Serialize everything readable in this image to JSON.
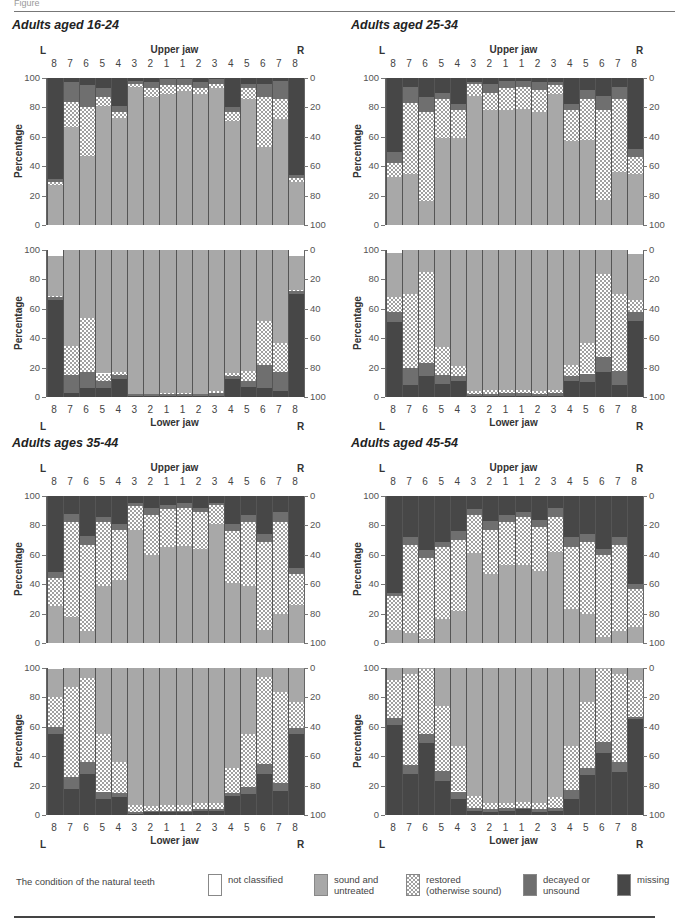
{
  "figure": {
    "label": "Figure"
  },
  "labels": {
    "upper_jaw": "Upper jaw",
    "lower_jaw": "Lower jaw",
    "left": "L",
    "right": "R",
    "ylabel": "Percentage",
    "left_ticks": [
      "100",
      "80",
      "60",
      "40",
      "20",
      "0"
    ],
    "right_ticks": [
      "0",
      "20",
      "40",
      "60",
      "80",
      "100"
    ],
    "teeth": [
      "8",
      "7",
      "6",
      "5",
      "4",
      "3",
      "2",
      "1",
      "1",
      "2",
      "3",
      "4",
      "5",
      "6",
      "7",
      "8"
    ]
  },
  "legend": {
    "caption": "The condition of the natural teeth",
    "items": [
      {
        "key": "notcl",
        "label1": "not classified",
        "label2": ""
      },
      {
        "key": "sound",
        "label1": "sound and",
        "label2": "untreated"
      },
      {
        "key": "restored",
        "label1": "restored",
        "label2": "(otherwise sound)"
      },
      {
        "key": "decayed",
        "label1": "decayed or",
        "label2": "unsound"
      },
      {
        "key": "missing",
        "label1": "missing",
        "label2": ""
      }
    ],
    "colors": {
      "sound": "#a8a8a8",
      "restored": "hatched",
      "decayed": "#6f6f6f",
      "missing": "#474747",
      "notcl": "#ffffff"
    }
  },
  "chart_data": [
    {
      "type": "bar",
      "title": "Adults aged 16-24",
      "stacked": true,
      "categories": [
        "L8",
        "L7",
        "L6",
        "L5",
        "L4",
        "L3",
        "L2",
        "L1",
        "R1",
        "R2",
        "R3",
        "R4",
        "R5",
        "R6",
        "R7",
        "R8"
      ],
      "ylim": [
        0,
        100
      ],
      "ylabel": "Percentage",
      "upper_jaw": {
        "series": [
          {
            "name": "sound and untreated",
            "values": [
              27,
              67,
              47,
              81,
              73,
              94,
              87,
              89,
              91,
              89,
              93,
              71,
              86,
              53,
              72,
              29
            ]
          },
          {
            "name": "restored (otherwise sound)",
            "values": [
              2,
              17,
              33,
              6,
              4,
              2,
              6,
              6,
              4,
              4,
              3,
              6,
              7,
              34,
              14,
              3
            ]
          },
          {
            "name": "decayed or unsound",
            "values": [
              2,
              13,
              15,
              6,
              4,
              2,
              4,
              4,
              4,
              4,
              3,
              3,
              3,
              9,
              12,
              2
            ]
          },
          {
            "name": "missing",
            "values": [
              69,
              3,
              5,
              7,
              19,
              2,
              3,
              1,
              1,
              3,
              1,
              20,
              4,
              4,
              2,
              66
            ]
          }
        ]
      },
      "lower_jaw": {
        "series": [
          {
            "name": "missing",
            "values": [
              66,
              3,
              6,
              6,
              12,
              1,
              1,
              1,
              1,
              1,
              1,
              12,
              7,
              6,
              4,
              70
            ]
          },
          {
            "name": "decayed or unsound",
            "values": [
              2,
              12,
              11,
              5,
              3,
              1,
              1,
              1,
              1,
              1,
              2,
              2,
              4,
              16,
              13,
              2
            ]
          },
          {
            "name": "restored (otherwise sound)",
            "values": [
              1,
              20,
              37,
              5,
              2,
              0,
              0,
              1,
              1,
              0,
              1,
              2,
              7,
              30,
              20,
              1
            ]
          },
          {
            "name": "sound and untreated",
            "values": [
              27,
              65,
              46,
              84,
              83,
              98,
              98,
              97,
              97,
              98,
              96,
              84,
              82,
              48,
              63,
              23
            ]
          },
          {
            "name": "not classified",
            "values": [
              4,
              0,
              0,
              0,
              0,
              0,
              0,
              0,
              0,
              0,
              0,
              0,
              0,
              0,
              0,
              4
            ]
          }
        ]
      }
    },
    {
      "type": "bar",
      "title": "Adults aged 25-34",
      "stacked": true,
      "categories": [
        "L8",
        "L7",
        "L6",
        "L5",
        "L4",
        "L3",
        "L2",
        "L1",
        "R1",
        "R2",
        "R3",
        "R4",
        "R5",
        "R6",
        "R7",
        "R8"
      ],
      "ylim": [
        0,
        100
      ],
      "ylabel": "Percentage",
      "upper_jaw": {
        "series": [
          {
            "name": "sound and untreated",
            "values": [
              33,
              35,
              16,
              59,
              59,
              88,
              78,
              78,
              79,
              77,
              89,
              57,
              58,
              17,
              36,
              35
            ]
          },
          {
            "name": "restored (otherwise sound)",
            "values": [
              9,
              48,
              61,
              27,
              19,
              8,
              12,
              15,
              15,
              15,
              6,
              21,
              28,
              61,
              50,
              11
            ]
          },
          {
            "name": "decayed or unsound",
            "values": [
              8,
              11,
              10,
              4,
              4,
              1,
              6,
              5,
              4,
              5,
              2,
              4,
              6,
              10,
              8,
              6
            ]
          },
          {
            "name": "missing",
            "values": [
              50,
              6,
              13,
              10,
              18,
              3,
              4,
              2,
              2,
              3,
              3,
              18,
              8,
              12,
              6,
              48
            ]
          }
        ]
      },
      "lower_jaw": {
        "series": [
          {
            "name": "missing",
            "values": [
              51,
              8,
              14,
              9,
              11,
              1,
              1,
              1,
              1,
              1,
              1,
              11,
              10,
              17,
              8,
              52
            ]
          },
          {
            "name": "decayed or unsound",
            "values": [
              7,
              12,
              9,
              6,
              3,
              1,
              1,
              2,
              2,
              1,
              2,
              3,
              6,
              10,
              10,
              6
            ]
          },
          {
            "name": "restored (otherwise sound)",
            "values": [
              10,
              50,
              62,
              19,
              7,
              2,
              3,
              2,
              2,
              2,
              2,
              8,
              21,
              57,
              52,
              8
            ]
          },
          {
            "name": "sound and untreated",
            "values": [
              30,
              30,
              15,
              66,
              79,
              96,
              95,
              95,
              95,
              96,
              95,
              78,
              63,
              16,
              30,
              31
            ]
          },
          {
            "name": "not classified",
            "values": [
              2,
              0,
              0,
              0,
              0,
              0,
              0,
              0,
              0,
              0,
              0,
              0,
              0,
              0,
              0,
              3
            ]
          }
        ]
      }
    },
    {
      "type": "bar",
      "title": "Adults ages 35-44",
      "stacked": true,
      "categories": [
        "L8",
        "L7",
        "L6",
        "L5",
        "L4",
        "L3",
        "L2",
        "L1",
        "R1",
        "R2",
        "R3",
        "R4",
        "R5",
        "R6",
        "R7",
        "R8"
      ],
      "ylim": [
        0,
        100
      ],
      "ylabel": "Percentage",
      "upper_jaw": {
        "series": [
          {
            "name": "sound and untreated",
            "values": [
              25,
              18,
              8,
              39,
              43,
              77,
              60,
              65,
              66,
              64,
              81,
              41,
              39,
              9,
              20,
              26
            ]
          },
          {
            "name": "restored (otherwise sound)",
            "values": [
              19,
              64,
              59,
              43,
              34,
              16,
              27,
              26,
              26,
              25,
              13,
              35,
              43,
              60,
              62,
              21
            ]
          },
          {
            "name": "decayed or unsound",
            "values": [
              4,
              6,
              6,
              4,
              4,
              2,
              5,
              3,
              3,
              3,
              1,
              5,
              5,
              5,
              7,
              4
            ]
          },
          {
            "name": "missing",
            "values": [
              52,
              12,
              27,
              14,
              19,
              5,
              8,
              6,
              5,
              8,
              5,
              19,
              13,
              26,
              11,
              49
            ]
          }
        ]
      },
      "lower_jaw": {
        "series": [
          {
            "name": "missing",
            "values": [
              55,
              18,
              28,
              11,
              12,
              1,
              2,
              2,
              2,
              3,
              3,
              13,
              14,
              28,
              16,
              55
            ]
          },
          {
            "name": "decayed or unsound",
            "values": [
              5,
              8,
              8,
              5,
              3,
              1,
              1,
              1,
              1,
              1,
              1,
              2,
              5,
              7,
              6,
              4
            ]
          },
          {
            "name": "restored (otherwise sound)",
            "values": [
              20,
              61,
              57,
              39,
              21,
              5,
              3,
              4,
              4,
              4,
              4,
              17,
              36,
              59,
              62,
              18
            ]
          },
          {
            "name": "sound and untreated",
            "values": [
              19,
              13,
              7,
              45,
              64,
              93,
              94,
              93,
              93,
              92,
              92,
              68,
              45,
              6,
              16,
              23
            ]
          },
          {
            "name": "not classified",
            "values": [
              1,
              0,
              0,
              0,
              0,
              0,
              0,
              0,
              0,
              0,
              0,
              0,
              0,
              0,
              0,
              0
            ]
          }
        ]
      }
    },
    {
      "type": "bar",
      "title": "Adults aged 45-54",
      "stacked": true,
      "categories": [
        "L8",
        "L7",
        "L6",
        "L5",
        "L4",
        "L3",
        "L2",
        "L1",
        "R1",
        "R2",
        "R3",
        "R4",
        "R5",
        "R6",
        "R7",
        "R8"
      ],
      "ylim": [
        0,
        100
      ],
      "ylabel": "Percentage",
      "upper_jaw": {
        "series": [
          {
            "name": "sound and untreated",
            "values": [
              9,
              7,
              3,
              16,
              22,
              61,
              47,
              53,
              53,
              49,
              62,
              23,
              20,
              4,
              8,
              11
            ]
          },
          {
            "name": "restored (otherwise sound)",
            "values": [
              23,
              60,
              55,
              49,
              48,
              26,
              30,
              29,
              33,
              30,
              24,
              42,
              49,
              56,
              59,
              26
            ]
          },
          {
            "name": "decayed or unsound",
            "values": [
              2,
              5,
              5,
              4,
              6,
              4,
              6,
              5,
              3,
              5,
              6,
              7,
              5,
              4,
              5,
              3
            ]
          },
          {
            "name": "missing",
            "values": [
              66,
              28,
              37,
              31,
              24,
              9,
              17,
              13,
              11,
              16,
              8,
              28,
              26,
              36,
              28,
              60
            ]
          }
        ]
      },
      "lower_jaw": {
        "series": [
          {
            "name": "missing",
            "values": [
              61,
              28,
              49,
              23,
              11,
              3,
              2,
              3,
              4,
              2,
              3,
              11,
              27,
              42,
              29,
              65
            ]
          },
          {
            "name": "decayed or unsound",
            "values": [
              5,
              6,
              6,
              7,
              5,
              2,
              2,
              2,
              1,
              2,
              2,
              6,
              5,
              8,
              7,
              2
            ]
          },
          {
            "name": "restored (otherwise sound)",
            "values": [
              26,
              62,
              44,
              44,
              31,
              8,
              4,
              3,
              4,
              4,
              7,
              30,
              45,
              49,
              60,
              25
            ]
          },
          {
            "name": "sound and untreated",
            "values": [
              8,
              4,
              1,
              26,
              53,
              87,
              92,
              92,
              91,
              92,
              88,
              53,
              23,
              1,
              4,
              8
            ]
          },
          {
            "name": "not classified",
            "values": [
              0,
              0,
              0,
              0,
              0,
              0,
              0,
              0,
              0,
              0,
              0,
              0,
              0,
              0,
              0,
              0
            ]
          }
        ]
      }
    }
  ]
}
